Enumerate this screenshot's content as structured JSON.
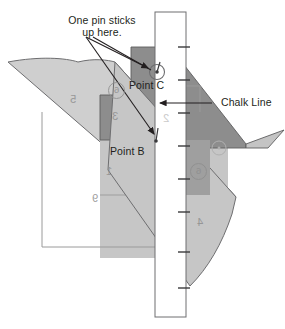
{
  "figure": {
    "background_color": "#ffffff",
    "ink_color": "#231f20"
  },
  "annotations": {
    "callout": {
      "line1": "One pin sticks",
      "line2": "up here."
    },
    "point_c": "Point C",
    "point_b": "Point B",
    "chalk_line": "Chalk Line"
  },
  "ghost_marks": {
    "n5": "5",
    "n3": "3",
    "n1": "1",
    "n9": "9",
    "n4": "4",
    "n2": "2",
    "c6_upper": "6",
    "c6_lower": "6",
    "c_small": "o"
  },
  "palette": {
    "paper_white": "#ffffff",
    "board_light": "#cfcfcf",
    "board_mid": "#bcbcbc",
    "board_dark": "#8d8d8d",
    "board_darker": "#848484",
    "outline": "#58585a",
    "thin_rule": "#9a9a9a",
    "ink": "#231f20"
  },
  "ruler": {
    "tick_count": 8,
    "orientation": "vertical",
    "edge": "right"
  }
}
